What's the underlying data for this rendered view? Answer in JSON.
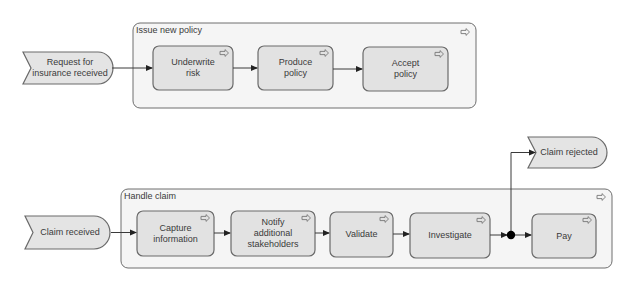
{
  "diagram": {
    "type": "process-flow",
    "colors": {
      "task_fill": "#e2e2e2",
      "container_fill": "#f5f5f5",
      "event_fill": "#e4e4e4",
      "stroke": "#6a6a6a",
      "flow": "#3a3a3a",
      "junction": "#000000"
    },
    "processes": [
      {
        "title": "Issue new policy",
        "trigger_event": "Request for insurance received",
        "tasks": [
          {
            "label_lines": [
              "Underwrite",
              "risk"
            ],
            "icon": "subprocess-arrow-icon"
          },
          {
            "label_lines": [
              "Produce",
              "policy"
            ],
            "icon": "subprocess-arrow-icon"
          },
          {
            "label_lines": [
              "Accept",
              "policy"
            ],
            "icon": "subprocess-arrow-icon"
          }
        ],
        "icon": "subprocess-arrow-icon"
      },
      {
        "title": "Handle claim",
        "trigger_event": "Claim received",
        "tasks": [
          {
            "label_lines": [
              "Capture",
              "information"
            ],
            "icon": "subprocess-arrow-icon"
          },
          {
            "label_lines": [
              "Notify",
              "additional",
              "stakeholders"
            ],
            "icon": "subprocess-arrow-icon"
          },
          {
            "label_lines": [
              "Validate"
            ],
            "icon": "subprocess-arrow-icon"
          },
          {
            "label_lines": [
              "Investigate"
            ],
            "icon": "subprocess-arrow-icon"
          },
          {
            "label_lines": [
              "Pay"
            ],
            "icon": "subprocess-arrow-icon"
          }
        ],
        "junction": "junction-dot",
        "result_event": "Claim rejected",
        "icon": "subprocess-arrow-icon"
      }
    ],
    "labels": {
      "event_request": "Request for insurance received",
      "event_request_l1": "Request for",
      "event_request_l2": "insurance received",
      "container1_title": "Issue new policy",
      "task_underwrite_l1": "Underwrite",
      "task_underwrite_l2": "risk",
      "task_produce_l1": "Produce",
      "task_produce_l2": "policy",
      "task_accept_l1": "Accept",
      "task_accept_l2": "policy",
      "event_claim_received": "Claim received",
      "container2_title": "Handle claim",
      "task_capture_l1": "Capture",
      "task_capture_l2": "information",
      "task_notify_l1": "Notify",
      "task_notify_l2": "additional",
      "task_notify_l3": "stakeholders",
      "task_validate": "Validate",
      "task_investigate": "Investigate",
      "task_pay": "Pay",
      "event_claim_rejected": "Claim rejected"
    }
  }
}
